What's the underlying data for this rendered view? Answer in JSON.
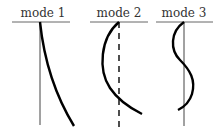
{
  "diagram": {
    "title": "",
    "panels": [
      {
        "label": "mode 1",
        "axis_style": "solid",
        "shape": "single-bend"
      },
      {
        "label": "mode 2",
        "axis_style": "dashed",
        "shape": "C-curve"
      },
      {
        "label": "mode 3",
        "axis_style": "solid",
        "shape": "S-curve"
      }
    ],
    "colors": {
      "line": "#555555",
      "curve": "#000000",
      "text": "#333333",
      "background": "#ffffff"
    }
  }
}
